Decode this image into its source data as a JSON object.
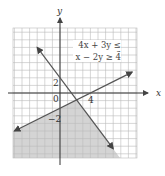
{
  "chart_data": {
    "type": "line",
    "title": "",
    "xlabel": "x",
    "ylabel": "y",
    "xlim": [
      -6,
      10
    ],
    "ylim": [
      -9,
      8
    ],
    "grid": true,
    "tick_labels": {
      "x": [
        "4"
      ],
      "y": [
        "2",
        "-2"
      ],
      "origin": "0"
    },
    "series": [
      {
        "name": "4x + 3y = 6",
        "points": [
          [
            -3,
            6
          ],
          [
            7,
            -7.33
          ]
        ],
        "style": "solid-arrows"
      },
      {
        "name": "x - 2y = 4",
        "points": [
          [
            -6,
            -5
          ],
          [
            9.5,
            2.75
          ]
        ],
        "style": "solid-arrows"
      }
    ],
    "shaded_region": "below both lines (4x+3y<=6 and x-2y>=4)",
    "annotations": [
      "4x + 3y ≤ 6",
      "x − 2y ≥ 4"
    ],
    "colors": {
      "grid": "#bbbbbb",
      "line": "#555555",
      "shade": "#d4d4d4"
    }
  },
  "labels": {
    "x_axis": "x",
    "y_axis": "y",
    "origin": "0",
    "tick_x4": "4",
    "tick_y2": "2",
    "tick_yneg2": "−2",
    "ineq1": "4x + 3y ≤ 6",
    "ineq2": "x − 2y ≥ 4"
  }
}
